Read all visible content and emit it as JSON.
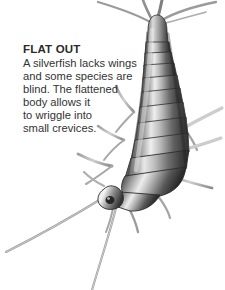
{
  "page": {
    "background_color": "#ffffff",
    "width": 225,
    "height": 290
  },
  "caption": {
    "heading": "FLAT OUT",
    "heading_color": "#2b2b2b",
    "body_color": "#333333",
    "lines": [
      "A silverfish lacks wings",
      "and some species are",
      "blind. The flattened",
      "body allows it",
      "to wriggle into",
      "small crevices."
    ],
    "full_text": "A silverfish lacks wings and some species are blind. The flattened body allows it to wriggle into small crevices."
  },
  "illustration": {
    "subject": "silverfish",
    "style": "grayscale pencil drawing",
    "orientation": "diagonal, tail at top right, head at bottom left",
    "colors": {
      "body_dark": "#3a3a3a",
      "body_mid": "#7c7c7c",
      "body_light": "#d8d8d8",
      "highlight": "#f2f2f2",
      "outline": "#2e2e2e",
      "appendage": "#8a8a8a"
    },
    "parts": {
      "cerci_count": 3,
      "antennae_count": 2,
      "leg_pairs": 3,
      "abdomen_segments": 10
    }
  }
}
